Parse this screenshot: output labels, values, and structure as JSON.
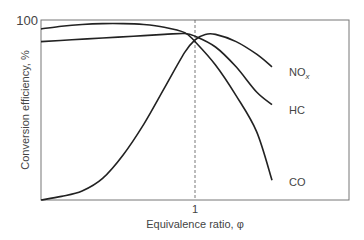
{
  "chart_data": {
    "type": "line",
    "title": "",
    "xlabel": "Equivalence ratio, φ",
    "ylabel": "Conversion efficiency, %",
    "x_ticks": [
      {
        "value": 1.0,
        "label": "1"
      }
    ],
    "y_ticks": [
      {
        "value": 100,
        "label": "100"
      }
    ],
    "xlim": [
      0.85,
      1.1
    ],
    "ylim": [
      0,
      100
    ],
    "grid": false,
    "annotations": [
      {
        "type": "vline",
        "x": 1.0,
        "style": "dashed"
      }
    ],
    "legend": "inline labels at curve ends",
    "series": [
      {
        "name": "CO",
        "x": [
          0.85,
          0.87,
          0.89,
          0.91,
          0.93,
          0.95,
          0.97,
          0.99,
          1.0,
          1.02,
          1.04,
          1.06,
          1.075
        ],
        "y": [
          95,
          96.5,
          97.5,
          98,
          98,
          97.5,
          96,
          93,
          88,
          75,
          58,
          38,
          11
        ]
      },
      {
        "name": "HC",
        "x": [
          0.85,
          0.88,
          0.91,
          0.94,
          0.97,
          0.99,
          1.0,
          1.02,
          1.04,
          1.06,
          1.075
        ],
        "y": [
          88,
          89,
          90,
          91,
          92,
          92.5,
          91,
          85,
          74,
          60,
          53
        ]
      },
      {
        "name": "NOx",
        "x": [
          0.85,
          0.87,
          0.89,
          0.91,
          0.93,
          0.95,
          0.97,
          0.99,
          1.0,
          1.01,
          1.02,
          1.04,
          1.06,
          1.075
        ],
        "y": [
          0,
          2,
          5,
          12,
          25,
          42,
          62,
          82,
          89,
          92,
          92,
          88,
          81,
          74
        ]
      }
    ]
  },
  "labels": {
    "y_top": "100",
    "x_tick": "1",
    "xlabel": "Equivalence ratio, φ",
    "ylabel": "Conversion efficiency, %",
    "no_base": "NO",
    "no_sub": "x",
    "hc": "HC",
    "co": "CO"
  }
}
